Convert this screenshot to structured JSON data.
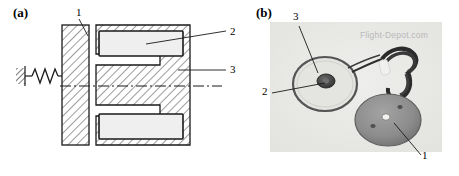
{
  "figure": {
    "panel_a": {
      "label": "(a)",
      "caption_type": "cross-section schematic of solenoid actuator with return spring",
      "callouts": [
        {
          "id": "1",
          "text": "1",
          "x": 76,
          "y": 13,
          "target": "armature-plate"
        },
        {
          "id": "2",
          "text": "2",
          "x": 230,
          "y": 33,
          "target": "coil-winding"
        },
        {
          "id": "3",
          "text": "3",
          "x": 230,
          "y": 70,
          "target": "magnetic-core"
        }
      ],
      "elements": {
        "spring_label": "return-spring",
        "ground_label": "fixed-wall-hatch",
        "centerline_label": "axis-centerline",
        "armature_label": "armature-plate",
        "core_label": "c-shaped-magnetic-core",
        "coil_top_label": "upper-coil-window",
        "coil_bottom_label": "lower-coil-window"
      }
    },
    "panel_b": {
      "label": "(b)",
      "caption_type": "photograph of solenoid coil, lead wires and steel disc armature",
      "watermark": "Flight-Depot.com",
      "callouts": [
        {
          "id": "3",
          "text": "3",
          "x": 295,
          "y": 17,
          "target": "coil-outer-ring"
        },
        {
          "id": "2",
          "text": "2",
          "x": 264,
          "y": 90,
          "target": "coil-center-hub"
        },
        {
          "id": "1",
          "text": "1",
          "x": 424,
          "y": 156,
          "target": "steel-disc"
        }
      ],
      "parts": {
        "coil": "solenoid-coil",
        "wires": "lead-wire-bundle",
        "disc": "steel-disc-armature"
      }
    },
    "colors": {
      "line": "#1a1a1a",
      "hatch": "#4a4a4a",
      "coil_fill": "#eeeeee",
      "photo_bg": "#e9e9e7",
      "photo_dark": "#3b3b3b",
      "disc_gray": "#8d8d8d",
      "watermark": "#b9b9b9"
    }
  }
}
